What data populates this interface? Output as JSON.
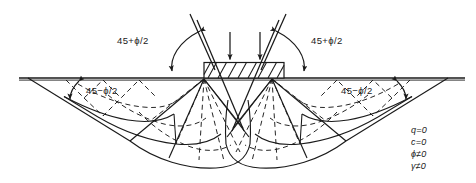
{
  "figure": {
    "ground_line": {
      "name": "ground-surface"
    },
    "footing": {
      "name": "strip-footing",
      "hatched": true
    },
    "labels": {
      "angle_top_left": "45+ϕ/2",
      "angle_top_right": "45+ϕ/2",
      "angle_surface_left": "45−ϕ/2",
      "angle_surface_right": "45−ϕ/2"
    },
    "legend": {
      "name": "soil-conditions",
      "lines": [
        "q=0",
        "c=0",
        "ϕ≠0",
        "γ≠0"
      ]
    },
    "loads": {
      "name": "applied-load-arrows",
      "count": 2,
      "direction": "down"
    },
    "colors": {
      "background": "#ffffff",
      "line": "#1a1a1a",
      "dashed": "#1a1a1a"
    }
  }
}
